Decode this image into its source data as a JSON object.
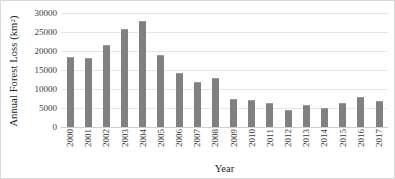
{
  "chart_data": {
    "type": "bar",
    "title": "",
    "xlabel": "Year",
    "ylabel": "Annual Forest Loss (km²)",
    "ylabel_prefix": "Annual Forest Loss (km",
    "ylabel_superscript": "2",
    "ylabel_suffix": ")",
    "categories": [
      "2000",
      "2001",
      "2002",
      "2003",
      "2004",
      "2005",
      "2006",
      "2007",
      "2008",
      "2009",
      "2010",
      "2011",
      "2012",
      "2013",
      "2014",
      "2015",
      "2016",
      "2017"
    ],
    "values": [
      18400,
      18200,
      21700,
      25800,
      27800,
      19000,
      14300,
      11800,
      13000,
      7500,
      7000,
      6400,
      4600,
      5900,
      5000,
      6200,
      8000,
      6900
    ],
    "ylim": [
      0,
      30000
    ],
    "ytick_values": [
      0,
      5000,
      10000,
      15000,
      20000,
      25000,
      30000
    ],
    "ytick_labels": [
      "0",
      "5000",
      "10000",
      "15000",
      "20000",
      "25000",
      "30000"
    ],
    "grid": true,
    "legend": "none",
    "series_color": "#808080",
    "gridline_color": "#e6e6e6",
    "axis_text_color": "#3a3a3a",
    "background_color": "#ffffff"
  }
}
